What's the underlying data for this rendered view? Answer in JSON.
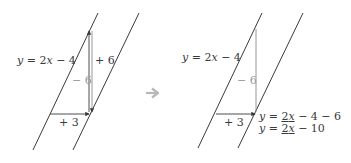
{
  "colors": {
    "line": "#3a3a3a",
    "arrow": "#3a3a3a",
    "grey_line": "#8c8c8c",
    "grey_label": "#9a9a9a",
    "transition_arrow": "#b8b8b8",
    "background": "#ffffff"
  },
  "left_panel": {
    "equation_label": {
      "y": "y",
      "eq": " = 2",
      "x": "x",
      "rest": " − 4"
    },
    "up_label": "+ 6",
    "down_label": "− 6",
    "run_label": "+ 3"
  },
  "transition": {
    "icon": "right-arrow-icon"
  },
  "right_panel": {
    "equation_label": {
      "y": "y",
      "eq": " = 2",
      "x": "x",
      "rest": " − 4"
    },
    "down_label": "− 6",
    "run_label": "+ 3",
    "result_line1": {
      "y": "y",
      "eq": " = ",
      "two_x_a": "2",
      "two_x_b": "x",
      "rest": " − 4 − 6"
    },
    "result_line2": {
      "y": "y",
      "eq": " = ",
      "two_x_a": "2",
      "two_x_b": "x",
      "rest": " − 10"
    }
  }
}
